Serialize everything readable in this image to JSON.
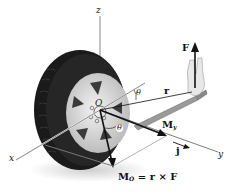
{
  "figure": {
    "axes": {
      "x": "x",
      "y": "y",
      "z": "z"
    },
    "origin": "O",
    "force": {
      "symbol": "F"
    },
    "position_vector": {
      "symbol": "r"
    },
    "angle": {
      "symbol": "θ",
      "second_symbol": "θ"
    },
    "moment_axis": {
      "symbol": "M",
      "subscript": "y"
    },
    "unit_vector": {
      "symbol": "j"
    },
    "moment_equation": {
      "lhs": "M",
      "lhs_sub": "O",
      "rhs": "= r × F"
    }
  },
  "colors": {
    "ink": "#111111",
    "tire": "#1c1c1c",
    "rim": "#d9d9d9",
    "axis": "#555555",
    "wrench": "#9a9a9a"
  }
}
